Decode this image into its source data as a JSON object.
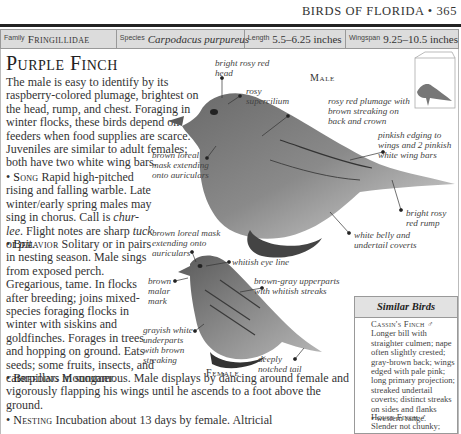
{
  "running_head": {
    "text": "BIRDS OF FLORIDA • 365"
  },
  "facts": {
    "family_label": "Family",
    "family_value": "Fringillidae",
    "species_label": "Species",
    "species_value": "Carpodacus purpureus",
    "length_label": "Length",
    "length_value": "5.5–6.25 inches",
    "wingspan_label": "Wingspan",
    "wingspan_value": "9.25–10.5 inches"
  },
  "title": "Purple Finch",
  "intro": "The male is easy to identify by its raspberry-colored plumage, brightest on the head, rump, and chest. Foraging in winter flocks, these birds depend on feeders when food supplies are scarce. Juveniles are similar to adult females; both have two white wing bars.",
  "sections": {
    "song": {
      "label": "Song",
      "text_a": " Rapid high-pitched rising and falling warble. Late winter/early spring males may sing in chorus. Call is ",
      "call": "chur-lee",
      "text_b": ". Flight notes are sharp ",
      "note1": "tuck",
      "text_c": " or ",
      "note2": "pit",
      "text_d": "."
    },
    "behavior": {
      "label": "Behavior",
      "text": " Solitary or in pairs in nesting season. Male sings from exposed perch. Gregarious, tame. In flocks after breeding; joins mixed-species foraging flocks in winter with siskins and goldfinches. Forages in trees and hopping on ground. Eats seeds; some fruits, insects, and caterpillars in summer."
    },
    "breeding": {
      "label": "Breeding",
      "text": " Monogamous. Male displays by dancing around female and vigorously flapping his wings until he ascends to a foot above the ground."
    },
    "nesting": {
      "label": "Nesting",
      "text": " Incubation about 13 days by female. Altricial"
    }
  },
  "bullet": "•",
  "male": {
    "label": "Male",
    "annotations": {
      "head": "bright rosy red head",
      "supercilium": "rosy supercilium",
      "back": "rosy red plumage with brown streaking on back and crown",
      "loreal": "brown loreal mask extending onto auriculars",
      "wings": "pinkish edging to wings and 2 pinkish white wing bars",
      "rump": "bright rosy red rump",
      "belly": "white belly and undertail coverts"
    }
  },
  "female": {
    "label": "Female",
    "annotations": {
      "loreal": "brown loreal mask extending onto auriculars",
      "eye_line": "whitish eye line",
      "upperparts": "brown-gray upperparts with whitish streaks",
      "malar": "brown malar mark",
      "underparts": "grayish white underparts with brown streaking",
      "tail": "deeply notched tail"
    }
  },
  "range_icon": "range-map-bird-icon",
  "similar_birds": {
    "heading": "Similar Birds",
    "entries": [
      {
        "name": "Cassin's Finch",
        "sex": "♂",
        "text": "Longer bill with straighter culmen; nape often slightly crested; gray-brown back; wings edged with pale pink; long primary projection; streaked undertail coverts; distinct streaks on sides and flanks",
        "note": "• western range."
      },
      {
        "name": "House Finch",
        "sex": "♂",
        "text": "Slender not chunky;"
      }
    ]
  },
  "colors": {
    "fact_bar_bg": "#dcdcdc",
    "rule": "#222222",
    "border": "#999999"
  }
}
